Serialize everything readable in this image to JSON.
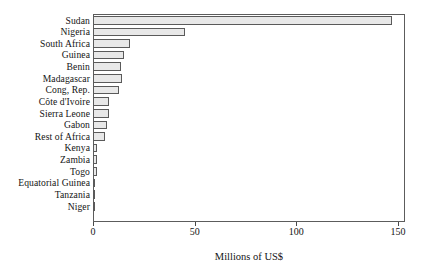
{
  "chart_data": {
    "type": "bar",
    "orientation": "horizontal",
    "title": "",
    "subtitle": "",
    "xlabel": "Millions of US$",
    "ylabel": "",
    "xlim": [
      0,
      150
    ],
    "xticks": [
      0,
      50,
      100,
      150
    ],
    "xtick_labels": [
      "0",
      "50",
      "100",
      "150"
    ],
    "grid": false,
    "legend": null,
    "categories": [
      "Sudan",
      "Nigeria",
      "South Africa",
      "Guinea",
      "Benin",
      "Madagascar",
      "Cong, Rep.",
      "Côte d'Ivoire",
      "Sierra Leone",
      "Gabon",
      "Rest of Africa",
      "Kenya",
      "Zambia",
      "Togo",
      "Equatorial Guinea",
      "Tanzania",
      "Niger"
    ],
    "values": [
      147,
      45,
      18,
      15,
      14,
      14.5,
      13,
      8,
      8,
      7,
      6,
      2,
      2,
      1.8,
      0.8,
      0.7,
      0.5
    ],
    "series": [
      {
        "name": "Millions of US$",
        "values": [
          147,
          45,
          18,
          15,
          14,
          14.5,
          13,
          8,
          8,
          7,
          6,
          2,
          2,
          1.8,
          0.8,
          0.7,
          0.5
        ]
      }
    ],
    "bar_fill_color": "#e8e8e8",
    "bar_edge_color": "#5a5a5a",
    "axis_color": "#5c5c5c",
    "background_color": "#ffffff"
  }
}
